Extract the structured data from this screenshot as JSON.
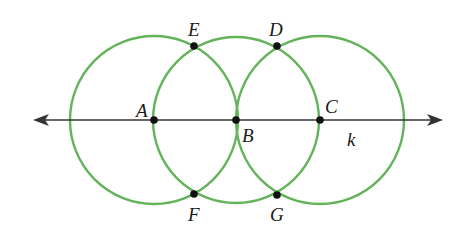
{
  "diagram": {
    "type": "geometric-construction",
    "colors": {
      "circle": "#63b35a",
      "line": "#333333",
      "point": "#111111",
      "label": "#1a1a1a",
      "background": "#ffffff"
    },
    "line": {
      "label": "k",
      "y": 120,
      "x1": 33,
      "x2": 443,
      "bidirectional": true
    },
    "circles": [
      {
        "id": "circle-A",
        "center": "A",
        "cx": 154,
        "cy": 120,
        "r": 84
      },
      {
        "id": "circle-B",
        "center": "B",
        "cx": 236,
        "cy": 120,
        "r": 83
      },
      {
        "id": "circle-C",
        "center": "C",
        "cx": 320,
        "cy": 120,
        "r": 84
      }
    ],
    "points": [
      {
        "label": "A",
        "x": 154,
        "y": 120,
        "lx": 136,
        "ly": 101
      },
      {
        "label": "B",
        "x": 236,
        "y": 120,
        "lx": 242,
        "ly": 126
      },
      {
        "label": "C",
        "x": 320,
        "y": 120,
        "lx": 325,
        "ly": 97
      },
      {
        "label": "D",
        "x": 277,
        "y": 46,
        "lx": 269,
        "ly": 20
      },
      {
        "label": "E",
        "x": 194,
        "y": 46,
        "lx": 188,
        "ly": 20
      },
      {
        "label": "F",
        "x": 194,
        "y": 194,
        "lx": 188,
        "ly": 205
      },
      {
        "label": "G",
        "x": 277,
        "y": 195,
        "lx": 270,
        "ly": 205
      }
    ],
    "line_label": {
      "text": "k",
      "x": 347,
      "y": 130
    }
  }
}
